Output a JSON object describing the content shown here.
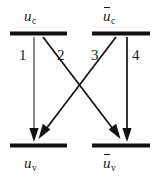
{
  "diagram": {
    "type": "energy-level-transition-diagram",
    "background_color": "#ffffff",
    "line_color": "#1a1a1a",
    "arrow1_color": "#6e6e6e",
    "levels": [
      {
        "id": "upper-left",
        "label_base": "u",
        "label_sub": "c",
        "overbar": false,
        "label_text": "u c"
      },
      {
        "id": "upper-right",
        "label_base": "u",
        "label_sub": "c",
        "overbar": true,
        "label_text": "ū c"
      },
      {
        "id": "lower-left",
        "label_base": "u",
        "label_sub": "v",
        "overbar": false,
        "label_text": "u v"
      },
      {
        "id": "lower-right",
        "label_base": "u",
        "label_sub": "v",
        "overbar": true,
        "label_text": "ū v"
      }
    ],
    "transitions": [
      {
        "number": "1",
        "from": "upper-left",
        "to": "lower-left",
        "kind": "vertical"
      },
      {
        "number": "2",
        "from": "upper-left",
        "to": "lower-right",
        "kind": "diagonal"
      },
      {
        "number": "3",
        "from": "upper-right",
        "to": "lower-left",
        "kind": "diagonal"
      },
      {
        "number": "4",
        "from": "upper-right",
        "to": "lower-right",
        "kind": "vertical"
      }
    ]
  }
}
